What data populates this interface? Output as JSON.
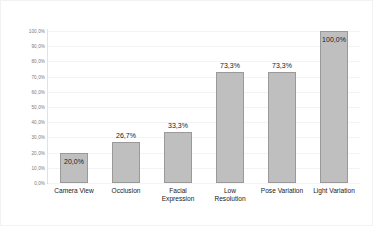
{
  "chart_data": {
    "type": "bar",
    "title": "",
    "subtitle": "",
    "xlabel": "",
    "ylabel": "",
    "ylim": [
      0,
      100
    ],
    "grid": true,
    "legend": false,
    "decimal_separator": ",",
    "categories": [
      "Camera View",
      "Occlusion",
      "Facial\nExpression",
      "Low\nResolution",
      "Pose Variation",
      "Light Variation"
    ],
    "values": [
      20.0,
      26.7,
      33.3,
      73.3,
      73.3,
      100.0
    ],
    "value_labels": [
      "20,0%",
      "26,7%",
      "33,3%",
      "73,3%",
      "73,3%",
      "100,0%"
    ],
    "label_placement": [
      "inside",
      "above",
      "above",
      "above",
      "above",
      "inside"
    ],
    "ytick_labels": [
      "100,0%",
      "90,0%",
      "80,0%",
      "70,0%",
      "60,0%",
      "50,0%",
      "40,0%",
      "30,0%",
      "20,0%",
      "10,0%",
      "0,0%"
    ],
    "ytick_values": [
      100,
      90,
      80,
      70,
      60,
      50,
      40,
      30,
      20,
      10,
      0
    ],
    "colors": {
      "bar_fill": "#bfbfbf",
      "bar_border": "#9a9a9a",
      "gridline": "#f4f4f4",
      "axis": "#d0d0d0",
      "tick_text": "#7a7a7a",
      "label_text": "#1a1a1a",
      "background": "#ffffff"
    }
  }
}
